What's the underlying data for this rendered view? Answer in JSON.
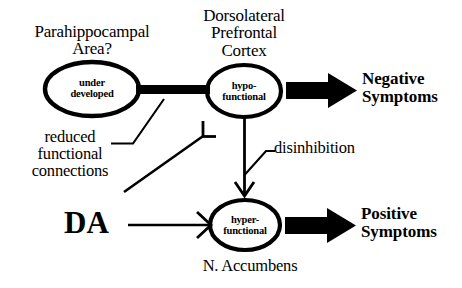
{
  "figure": {
    "type": "neuroanatomical-circuit-diagram",
    "background_color": "#ffffff",
    "ink_color": "#000000"
  },
  "nodes": [
    {
      "id": "parahippocampal",
      "caption": "Parahippocampal\nArea?",
      "inner_label": "under\ndeveloped",
      "shape": "ellipse",
      "cx": 92,
      "cy": 89,
      "rx": 47,
      "ry": 27
    },
    {
      "id": "dlpfc",
      "caption": "Dorsolateral\nPrefrontal\nCortex",
      "inner_label": "hypo-\nfunctional",
      "shape": "ellipse",
      "cx": 244,
      "cy": 91,
      "rx": 37,
      "ry": 26
    },
    {
      "id": "nucleus-accumbens",
      "caption": "N. Accumbens",
      "inner_label": "hyper-\nfunctional",
      "shape": "ellipse",
      "cx": 245,
      "cy": 225,
      "rx": 35,
      "ry": 25
    }
  ],
  "outcomes": [
    {
      "id": "negative",
      "label": "Negative\nSymptoms"
    },
    {
      "id": "positive",
      "label": "Positive\nSymptoms"
    }
  ],
  "annotations": [
    {
      "id": "reduced-connections",
      "label": "reduced\nfunctional\nconnections"
    },
    {
      "id": "disinhibition",
      "label": "disinhibition"
    },
    {
      "id": "dopamine",
      "label": "DA"
    }
  ],
  "connections": [
    {
      "id": "parahippocampal-to-dlpfc",
      "from": "parahippocampal",
      "to": "dlpfc",
      "style": "thick-bar",
      "terminal": "none",
      "annotated_by": "reduced-connections"
    },
    {
      "id": "reduced-connections-to-dlpfc-inhibition",
      "from": "reduced-connections",
      "to": "dlpfc",
      "style": "thin-line",
      "terminal": "inhibitory-bar"
    },
    {
      "id": "dlpfc-to-accumbens",
      "from": "dlpfc",
      "to": "nucleus-accumbens",
      "style": "thin-line",
      "terminal": "open-arrowhead",
      "annotated_by": "disinhibition"
    },
    {
      "id": "da-to-accumbens",
      "from": "dopamine",
      "to": "nucleus-accumbens",
      "style": "thin-line",
      "terminal": "open-arrowhead"
    },
    {
      "id": "dlpfc-to-negative",
      "from": "dlpfc",
      "to": "negative",
      "style": "block-arrow",
      "terminal": "solid-arrowhead"
    },
    {
      "id": "accumbens-to-positive",
      "from": "nucleus-accumbens",
      "to": "positive",
      "style": "block-arrow",
      "terminal": "solid-arrowhead"
    }
  ]
}
